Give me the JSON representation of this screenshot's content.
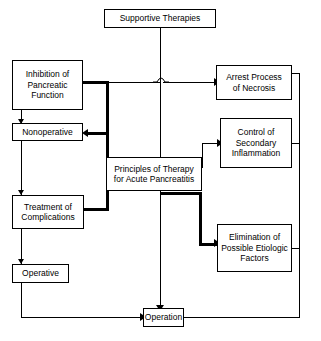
{
  "diagram": {
    "background_color": "#ffffff",
    "line_color": "#000000",
    "nodes": {
      "supportive_therapies": "Supportive Therapies",
      "inhibition_pancreatic": "Inhibition of\nPancreatic\nFunction",
      "arrest_necrosis": "Arrest Process\nof Necrosis",
      "nonoperative": "Nonoperative",
      "control_inflammation": "Control of\nSecondary\nInflammation",
      "center": "Principles of Therapy\nfor Acute Pancreatitis",
      "treatment_complications": "Treatment of\nComplications",
      "elimination_etiologic": "Elimination of\nPossible Etiologic\nFactors",
      "operative": "Operative",
      "operation": "Operation"
    }
  }
}
